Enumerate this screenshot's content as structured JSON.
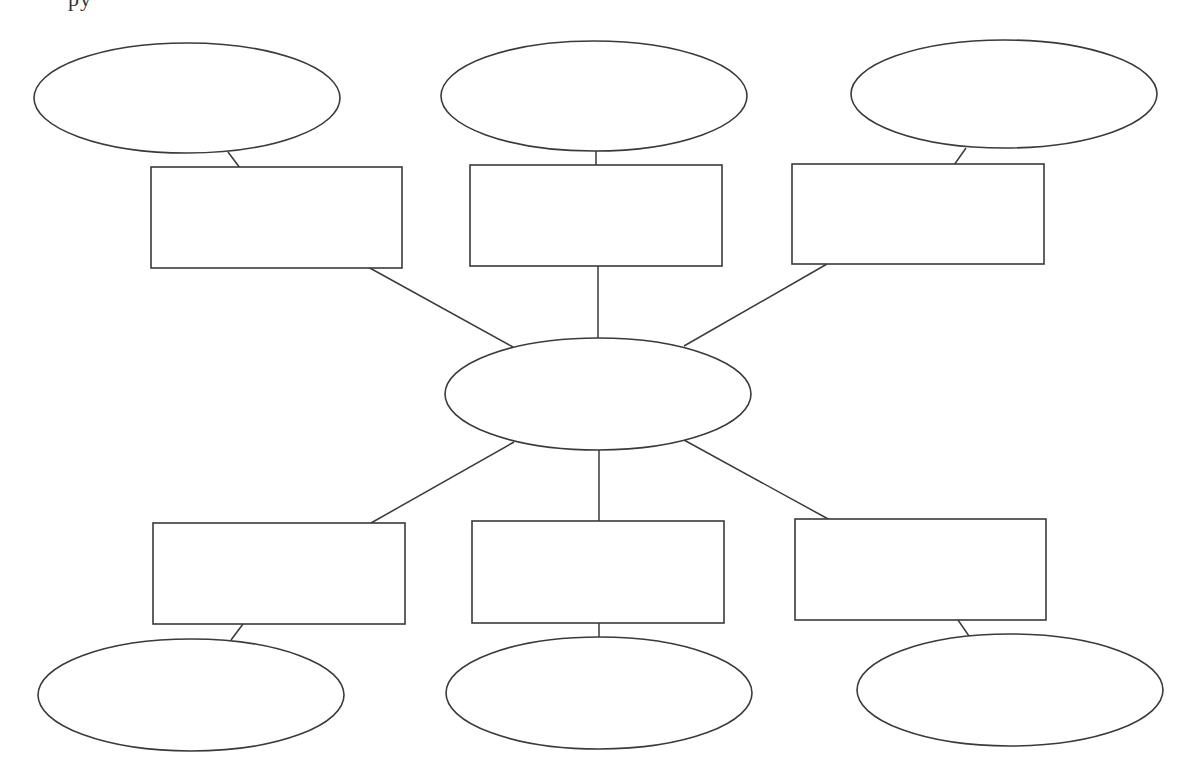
{
  "diagram": {
    "title": "",
    "type": "hub-and-spoke graphic organizer",
    "stroke_color": "#3a3a3a",
    "background_color": "#ffffff",
    "center": {
      "id": "center-ellipse",
      "shape": "ellipse",
      "cx": 598,
      "cy": 394,
      "rx": 153,
      "ry": 56,
      "label": ""
    },
    "branches": [
      {
        "id": "top-left",
        "box": {
          "x": 151,
          "y": 167,
          "w": 251,
          "h": 101,
          "label": ""
        },
        "ellipse": {
          "cx": 187,
          "cy": 98,
          "rx": 153,
          "ry": 55,
          "label": ""
        },
        "hub_connector": {
          "x1": 368,
          "y1": 267,
          "x2": 513,
          "y2": 347
        },
        "leaf_connector": {
          "x1": 228,
          "y1": 152,
          "x2": 240,
          "y2": 168
        }
      },
      {
        "id": "top-middle",
        "box": {
          "x": 470,
          "y": 165,
          "w": 252,
          "h": 101,
          "label": ""
        },
        "ellipse": {
          "cx": 594,
          "cy": 96,
          "rx": 153,
          "ry": 55,
          "label": ""
        },
        "hub_connector": {
          "x1": 598,
          "y1": 266,
          "x2": 598,
          "y2": 338
        },
        "leaf_connector": {
          "x1": 596,
          "y1": 151,
          "x2": 596,
          "y2": 165
        }
      },
      {
        "id": "top-right",
        "box": {
          "x": 792,
          "y": 164,
          "w": 252,
          "h": 100,
          "label": ""
        },
        "ellipse": {
          "cx": 1004,
          "cy": 94,
          "rx": 153,
          "ry": 54,
          "label": ""
        },
        "hub_connector": {
          "x1": 827,
          "y1": 264,
          "x2": 684,
          "y2": 346
        },
        "leaf_connector": {
          "x1": 966,
          "y1": 148,
          "x2": 954,
          "y2": 165
        }
      },
      {
        "id": "bottom-left",
        "box": {
          "x": 153,
          "y": 523,
          "w": 252,
          "h": 101,
          "label": ""
        },
        "ellipse": {
          "cx": 191,
          "cy": 695,
          "rx": 153,
          "ry": 56,
          "label": ""
        },
        "hub_connector": {
          "x1": 514,
          "y1": 442,
          "x2": 371,
          "y2": 523
        },
        "leaf_connector": {
          "x1": 243,
          "y1": 624,
          "x2": 231,
          "y2": 640
        }
      },
      {
        "id": "bottom-middle",
        "box": {
          "x": 472,
          "y": 521,
          "w": 252,
          "h": 102,
          "label": ""
        },
        "ellipse": {
          "cx": 599,
          "cy": 693,
          "rx": 153,
          "ry": 56,
          "label": ""
        },
        "hub_connector": {
          "x1": 599,
          "y1": 450,
          "x2": 599,
          "y2": 521
        },
        "leaf_connector": {
          "x1": 599,
          "y1": 623,
          "x2": 599,
          "y2": 637
        }
      },
      {
        "id": "bottom-right",
        "box": {
          "x": 795,
          "y": 519,
          "w": 251,
          "h": 101,
          "label": ""
        },
        "ellipse": {
          "cx": 1010,
          "cy": 690,
          "rx": 153,
          "ry": 56,
          "label": ""
        },
        "hub_connector": {
          "x1": 684,
          "y1": 440,
          "x2": 830,
          "y2": 520
        },
        "leaf_connector": {
          "x1": 958,
          "y1": 620,
          "x2": 969,
          "y2": 636
        }
      }
    ]
  }
}
